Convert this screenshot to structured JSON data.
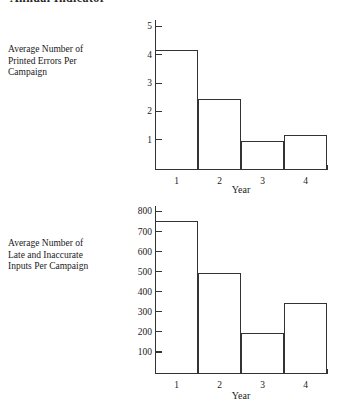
{
  "page": {
    "title": "Annual Indicator"
  },
  "charts": [
    {
      "label": "Average Number of Printed Errors Per Campaign",
      "xlabel": "Year",
      "categories": [
        "1",
        "2",
        "3",
        "4"
      ],
      "yticks": [
        "1",
        "2",
        "3",
        "4",
        "5"
      ]
    },
    {
      "label": "Average Number of Late and Inaccurate Inputs Per Campaign",
      "xlabel": "Year",
      "categories": [
        "1",
        "2",
        "3",
        "4"
      ],
      "yticks": [
        "100",
        "200",
        "300",
        "400",
        "500",
        "600",
        "700",
        "800"
      ]
    }
  ],
  "chart_data": [
    {
      "type": "bar",
      "title": "",
      "categories": [
        "1",
        "2",
        "3",
        "4"
      ],
      "values": [
        4.2,
        2.45,
        0.98,
        1.2
      ],
      "xlabel": "Year",
      "ylabel": "Average Number of Printed Errors Per Campaign",
      "ylim": [
        0,
        5.25
      ],
      "yticks": [
        1,
        2,
        3,
        4,
        5
      ],
      "grid": false,
      "legend": false,
      "style": "histogram-outline-contiguous"
    },
    {
      "type": "bar",
      "title": "",
      "categories": [
        "1",
        "2",
        "3",
        "4"
      ],
      "values": [
        755,
        495,
        195,
        345
      ],
      "xlabel": "Year",
      "ylabel": "Average Number of Late and Inaccurate Inputs Per Campaign",
      "ylim": [
        0,
        830
      ],
      "yticks": [
        100,
        200,
        300,
        400,
        500,
        600,
        700,
        800
      ],
      "grid": false,
      "legend": false,
      "style": "histogram-outline-contiguous"
    }
  ]
}
